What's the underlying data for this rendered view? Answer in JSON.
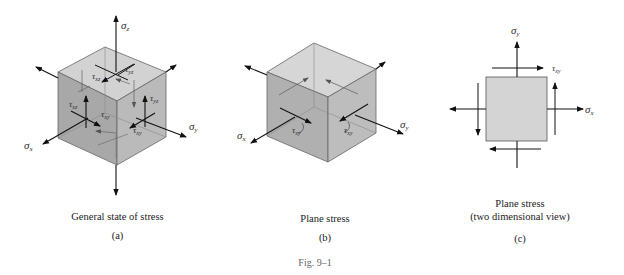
{
  "figure": {
    "label": "Fig. 9–1",
    "panels": [
      {
        "id": "a",
        "caption": "General state of stress",
        "sublabel": "(a)",
        "labels": {
          "sigma_z": "σz",
          "sigma_x": "σx",
          "sigma_y": "σy",
          "tau_xz": "τxz",
          "tau_yz": "τyz",
          "tau_xy": "τxy"
        }
      },
      {
        "id": "b",
        "caption": "Plane stress",
        "sublabel": "(b)",
        "labels": {
          "sigma_x": "σx",
          "sigma_y": "σy",
          "tau_xy": "τxy"
        }
      },
      {
        "id": "c",
        "caption_line1": "Plane stress",
        "caption_line2": "(two dimensional view)",
        "sublabel": "(c)",
        "labels": {
          "sigma_y": "σy",
          "sigma_x": "σx",
          "tau_xy": "τxy"
        }
      }
    ]
  },
  "colors": {
    "top_face": "#cfcfcf",
    "left_face": "#a9a9a9",
    "right_face": "#b9b9b9",
    "square_fill": "#d4d4d4",
    "arrow": "#111111"
  }
}
